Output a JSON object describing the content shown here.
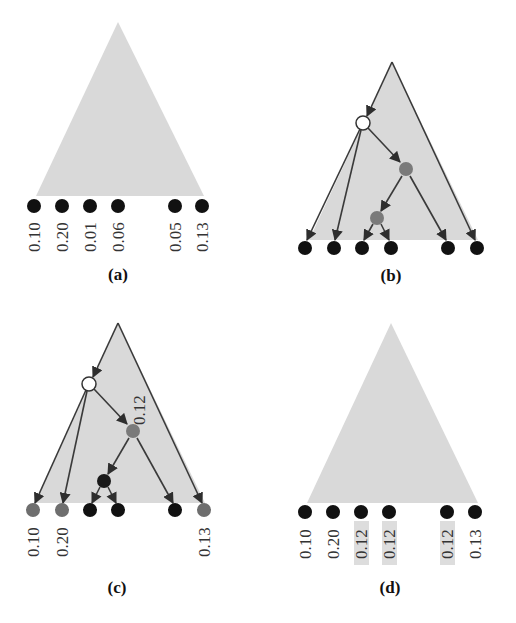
{
  "figure": {
    "panels": [
      {
        "id": "a",
        "label": "(a)",
        "leaf_values": [
          "0.10",
          "0.20",
          "0.01",
          "0.06",
          "0.05",
          "0.13"
        ]
      },
      {
        "id": "b",
        "label": "(b)",
        "leaf_values": []
      },
      {
        "id": "c",
        "label": "(c)",
        "leaf_values": [
          "0.10",
          "0.20",
          "",
          "",
          "",
          "0.13"
        ],
        "internal_value": "0.12"
      },
      {
        "id": "d",
        "label": "(d)",
        "leaf_values": [
          "0.10",
          "0.20",
          "0.12",
          "0.12",
          "0.12",
          "0.13"
        ],
        "highlighted_leaves": [
          2,
          3,
          4
        ]
      }
    ],
    "colors": {
      "triangle": "#d9d9d9",
      "leaf": "#111111",
      "gray_node": "#7a7a7a",
      "white_node": "#ffffff",
      "edge": "#3a3a3a",
      "highlight": "#dddddd"
    }
  }
}
